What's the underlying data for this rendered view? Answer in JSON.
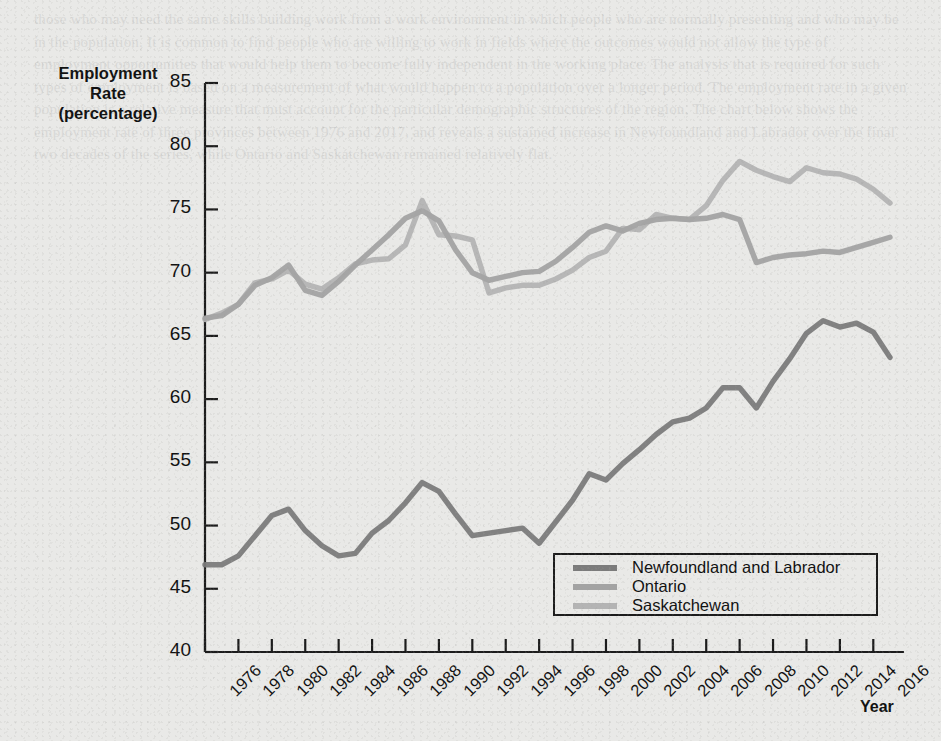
{
  "figure": {
    "y_axis_title_lines": [
      "Employment",
      "Rate",
      "(percentage)"
    ],
    "x_axis_title": "Year"
  },
  "legend": {
    "items": [
      {
        "label": "Newfoundland and Labrador",
        "color": "#7b7b7b"
      },
      {
        "label": "Ontario",
        "color": "#a3a3a3"
      },
      {
        "label": "Saskatchewan",
        "color": "#b4b4b4"
      }
    ]
  },
  "ghost_page_text": "those who may need the same skills building work from a work environment in which people who are normally presenting and who may be in the population. It is common to find people who are willing to work in fields where the outcomes would not allow the type of employment opportunities that would help them to become fully independent in the working place. The analysis that is required for such types of employment is based on a measurement of what would happen to a population over a longer period. The employment rate in a given population is a relative measure that must account for the particular demographic structures of the region. The chart below shows the employment rate of three provinces between 1976 and 2017, and reveals a sustained increase in Newfoundland and Labrador over the final two decades of the series, while Ontario and Saskatchewan remained relatively flat.",
  "chart_data": {
    "type": "line",
    "title": "",
    "xlabel": "Year",
    "ylabel": "Employment Rate (percentage)",
    "xlim": [
      1976,
      2017
    ],
    "ylim": [
      40,
      85
    ],
    "ytick_step": 5,
    "yticks": [
      40,
      45,
      50,
      55,
      60,
      65,
      70,
      75,
      80,
      85
    ],
    "xticks": [
      1976,
      1978,
      1980,
      1982,
      1984,
      1986,
      1988,
      1990,
      1992,
      1994,
      1996,
      1998,
      2000,
      2002,
      2004,
      2006,
      2008,
      2010,
      2012,
      2014,
      2016
    ],
    "xtick_labels": [
      "1976",
      "1978",
      "1980",
      "1982",
      "1984",
      "1986",
      "1988",
      "1990",
      "1992",
      "1994",
      "1996",
      "1998",
      "2000",
      "2002",
      "2004",
      "2006",
      "2008",
      "2010",
      "2012",
      "2014",
      "2016"
    ],
    "grid": false,
    "legend_position": "lower-right-inside",
    "x": [
      1976,
      1977,
      1978,
      1979,
      1980,
      1981,
      1982,
      1983,
      1984,
      1985,
      1986,
      1987,
      1988,
      1989,
      1990,
      1991,
      1992,
      1993,
      1994,
      1995,
      1996,
      1997,
      1998,
      1999,
      2000,
      2001,
      2002,
      2003,
      2004,
      2005,
      2006,
      2007,
      2008,
      2009,
      2010,
      2011,
      2012,
      2013,
      2014,
      2015,
      2016,
      2017
    ],
    "series": [
      {
        "name": "Newfoundland and Labrador",
        "color": "#7b7b7b",
        "values": [
          46.9,
          46.9,
          47.6,
          49.2,
          50.8,
          51.3,
          49.6,
          48.4,
          47.6,
          47.8,
          49.4,
          50.4,
          51.8,
          53.4,
          52.7,
          50.9,
          49.2,
          49.4,
          49.6,
          49.8,
          48.6,
          50.3,
          52.0,
          54.1,
          53.6,
          54.9,
          56.0,
          57.2,
          58.2,
          58.5,
          59.3,
          60.9,
          60.9,
          59.3,
          61.4,
          63.2,
          65.2,
          66.2,
          65.7,
          66.0,
          65.3,
          63.3
        ]
      },
      {
        "name": "Ontario",
        "color": "#a3a3a3",
        "values": [
          66.4,
          66.6,
          67.5,
          69.0,
          69.6,
          70.6,
          68.6,
          68.2,
          69.3,
          70.6,
          71.8,
          73.0,
          74.3,
          74.9,
          74.1,
          71.8,
          70.0,
          69.4,
          69.7,
          70.0,
          70.1,
          70.9,
          72.0,
          73.2,
          73.7,
          73.3,
          73.9,
          74.2,
          74.3,
          74.2,
          74.3,
          74.6,
          74.2,
          70.8,
          71.2,
          71.4,
          71.5,
          71.7,
          71.6,
          72.0,
          72.4,
          72.8
        ]
      },
      {
        "name": "Saskatchewan",
        "color": "#b4b4b4",
        "values": [
          66.3,
          66.8,
          67.5,
          69.2,
          69.5,
          70.2,
          69.1,
          68.7,
          69.6,
          70.7,
          71.0,
          71.1,
          72.2,
          75.7,
          73.0,
          72.9,
          72.6,
          68.4,
          68.8,
          69.0,
          69.0,
          69.5,
          70.2,
          71.2,
          71.7,
          73.5,
          73.4,
          74.6,
          74.3,
          74.2,
          75.3,
          77.3,
          78.8,
          78.1,
          77.6,
          77.2,
          78.3,
          77.9,
          77.8,
          77.4,
          76.6,
          75.5
        ]
      }
    ]
  }
}
